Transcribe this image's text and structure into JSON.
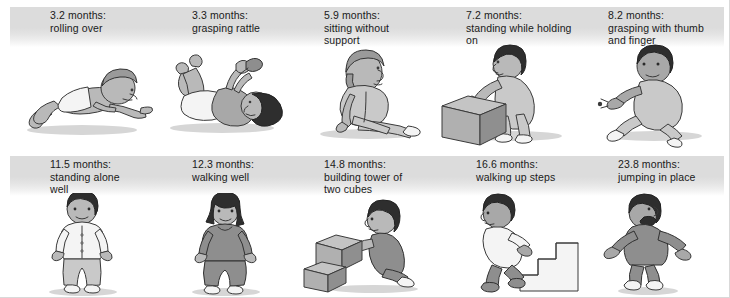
{
  "figure": {
    "rows": [
      {
        "panels": [
          {
            "age": "3.2 months:",
            "milestone": "rolling over",
            "caption": "3.2 months:\nrolling over",
            "art": "baby-prone-rolling-over",
            "indent": "normal"
          },
          {
            "age": "3.3 months:",
            "milestone": "grasping rattle",
            "caption": "3.3 months:\ngrasping rattle",
            "art": "baby-supine-grasping-rattle",
            "indent": "normal"
          },
          {
            "age": "5.9 months:",
            "milestone": "sitting without support",
            "caption": "5.9 months:\nsitting without\nsupport",
            "art": "baby-sitting-unsupported",
            "indent": "wide"
          },
          {
            "age": "7.2 months:",
            "milestone": "standing while holding on",
            "caption": "7.2 months:\nstanding while holding\non",
            "art": "baby-standing-holding-box",
            "indent": "wide"
          },
          {
            "age": "8.2 months:",
            "milestone": "grasping with thumb and finger",
            "caption": "8.2 months:\ngrasping with thumb\nand finger",
            "art": "baby-pincer-grasp",
            "indent": "wide"
          }
        ]
      },
      {
        "panels": [
          {
            "age": "11.5 months:",
            "milestone": "standing alone well",
            "caption": "11.5 months:\nstanding alone\nwell",
            "art": "toddler-standing-alone",
            "indent": "normal"
          },
          {
            "age": "12.3 months:",
            "milestone": "walking well",
            "caption": "12.3 months:\nwalking well",
            "art": "toddler-walking-well",
            "indent": "normal"
          },
          {
            "age": "14.8 months:",
            "milestone": "building tower of two cubes",
            "caption": "14.8 months:\nbuilding tower of\ntwo cubes",
            "art": "toddler-stacking-cubes",
            "indent": "wide"
          },
          {
            "age": "16.6 months:",
            "milestone": "walking up steps",
            "caption": "16.6 months:\nwalking up steps",
            "art": "toddler-climbing-steps",
            "indent": "normal"
          },
          {
            "age": "23.8 months:",
            "milestone": "jumping in place",
            "caption": "23.8 months:\njumping in place",
            "art": "toddler-jumping",
            "indent": "normal"
          }
        ]
      }
    ],
    "colors": {
      "band_top": "#dcdcdc",
      "band_bottom": "#ffffff",
      "text": "#1a1a1a",
      "background": "#ffffff",
      "outline": "#3a3a3a",
      "skin": "#b9b9b9",
      "hair_dark": "#2e2e2e",
      "hair_light": "#9a9a9a"
    }
  }
}
